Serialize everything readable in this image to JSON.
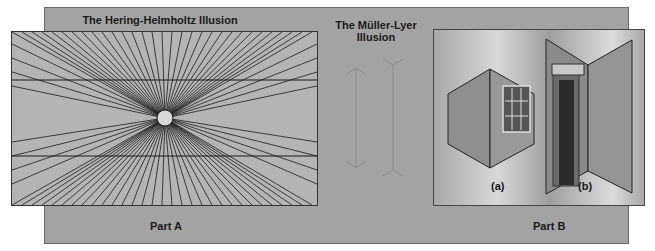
{
  "figure": {
    "part_a": {
      "title": "The Hering-Helmholtz Illusion",
      "label": "Part A"
    },
    "middle": {
      "title_line1": "The Müller-Lyer",
      "title_line2": "Illusion"
    },
    "part_b": {
      "label": "Part B",
      "sub_a": "(a)",
      "sub_b": "(b)"
    }
  },
  "colors": {
    "outer_panel": "#a3a3a3",
    "inner_panel": "#b4b4b4",
    "lines": "#1a1a1a",
    "muller_lyer_lines": "#8a8a8a"
  }
}
